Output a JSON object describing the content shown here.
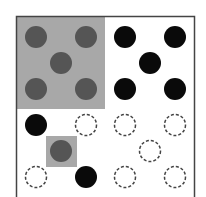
{
  "diagram": {
    "frame": {
      "x": 16.5,
      "y": 16.5,
      "width": 178,
      "height": 200,
      "stroke": "#444444"
    },
    "highlights": [
      {
        "name": "top-left-quadrant-highlight",
        "x": 17,
        "y": 17,
        "width": 88,
        "height": 92,
        "fill": "#a8a8a8"
      },
      {
        "name": "center-cell-highlight",
        "x": 46,
        "y": 136,
        "width": 31,
        "height": 31,
        "fill": "#a8a8a8"
      }
    ],
    "colors": {
      "black": "#0a0a0a",
      "gray": "#555555",
      "dashed": "#444444"
    },
    "radius": 11,
    "circles": [
      {
        "x": 36,
        "y": 37,
        "style": "gray"
      },
      {
        "x": 86,
        "y": 37,
        "style": "gray"
      },
      {
        "x": 61,
        "y": 63,
        "style": "gray"
      },
      {
        "x": 36,
        "y": 89,
        "style": "gray"
      },
      {
        "x": 86,
        "y": 89,
        "style": "gray"
      },
      {
        "x": 125,
        "y": 37,
        "style": "black"
      },
      {
        "x": 175,
        "y": 37,
        "style": "black"
      },
      {
        "x": 150,
        "y": 63,
        "style": "black"
      },
      {
        "x": 125,
        "y": 89,
        "style": "black"
      },
      {
        "x": 175,
        "y": 89,
        "style": "black"
      },
      {
        "x": 36,
        "y": 125,
        "style": "black"
      },
      {
        "x": 86,
        "y": 125,
        "style": "dashed"
      },
      {
        "x": 61,
        "y": 151,
        "style": "gray"
      },
      {
        "x": 36,
        "y": 177,
        "style": "dashed"
      },
      {
        "x": 86,
        "y": 177,
        "style": "black"
      },
      {
        "x": 125,
        "y": 125,
        "style": "dashed"
      },
      {
        "x": 175,
        "y": 125,
        "style": "dashed"
      },
      {
        "x": 150,
        "y": 151,
        "style": "dashed"
      },
      {
        "x": 125,
        "y": 177,
        "style": "dashed"
      },
      {
        "x": 175,
        "y": 177,
        "style": "dashed"
      }
    ]
  }
}
